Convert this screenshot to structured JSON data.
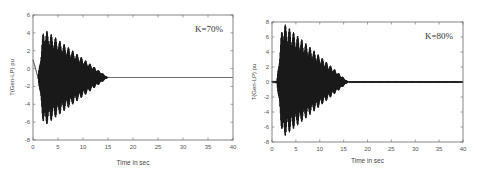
{
  "chart_data": [
    {
      "type": "line",
      "title": "",
      "annotation": "K=70%",
      "xlabel": "Time in sec",
      "ylabel": "T(Gen-LP) pu",
      "xlim": [
        0,
        40
      ],
      "ylim": [
        -8,
        6
      ],
      "xticks": [
        0,
        5,
        10,
        15,
        20,
        25,
        30,
        35,
        40
      ],
      "yticks": [
        -8,
        -6,
        -4,
        -2,
        0,
        2,
        4,
        6
      ],
      "grid": false,
      "series": [
        {
          "name": "torque",
          "description": "Damped oscillation beginning near t=1 s; envelope about +4.5/-6.5 pu decaying to a steady value of about -1 pu by t≈15 s",
          "steady_value": -1,
          "peak_max": 4.5,
          "peak_min": -6.5,
          "onset_time": 1,
          "settle_time": 15
        }
      ]
    },
    {
      "type": "line",
      "title": "",
      "annotation": "K=80%",
      "xlabel": "Time in sec",
      "ylabel": "T(Gen-LP) pu",
      "xlim": [
        0,
        40
      ],
      "ylim": [
        -8,
        8
      ],
      "xticks": [
        0,
        5,
        10,
        15,
        20,
        25,
        30,
        35,
        40
      ],
      "yticks": [
        -8,
        -6,
        -4,
        -2,
        0,
        2,
        4,
        6,
        8
      ],
      "grid": false,
      "series": [
        {
          "name": "torque",
          "description": "Damped oscillation beginning near t=1 s; envelope about +8/-7.5 pu decaying to a steady value of about 0 pu by t≈16 s, with small residual ripple afterward",
          "steady_value": 0,
          "peak_max": 8,
          "peak_min": -7.5,
          "onset_time": 1,
          "settle_time": 16
        }
      ]
    }
  ]
}
